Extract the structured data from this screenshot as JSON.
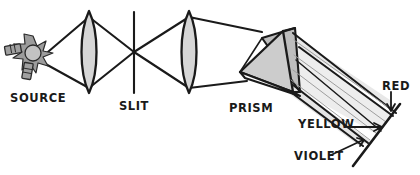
{
  "figure": {
    "type": "optics-ray-diagram",
    "width": 420,
    "height": 175,
    "background": "#ffffff",
    "ink_color": "#1a1a1a"
  },
  "labels": {
    "source": "SOURCE",
    "slit": "SLIT",
    "prism": "PRISM",
    "red": "RED",
    "yellow": "YELLOW",
    "violet": "VIOLET"
  },
  "components": [
    {
      "name": "light-source-bulb",
      "label": "SOURCE",
      "shape": "bulb-with-starburst",
      "x": 30,
      "y": 53,
      "fill": "#a8a8a8"
    },
    {
      "name": "condenser-lens",
      "label": "",
      "shape": "biconvex-lens",
      "x": 89,
      "y": 52,
      "fill": "#d6d6d6"
    },
    {
      "name": "slit-aperture",
      "label": "SLIT",
      "shape": "vertical-line",
      "x": 134,
      "y": 52,
      "fill": "none"
    },
    {
      "name": "collimating-lens",
      "label": "",
      "shape": "biconvex-lens",
      "x": 189,
      "y": 52,
      "fill": "#d6d6d6"
    },
    {
      "name": "dispersing-prism",
      "label": "PRISM",
      "shape": "triangular-prism-3d",
      "x": 285,
      "y": 70,
      "fill": "#c9c9c9"
    },
    {
      "name": "projection-screen",
      "label": "",
      "shape": "diagonal-line",
      "x": 388,
      "y": 125,
      "fill": "none"
    }
  ],
  "spectrum": [
    {
      "name": "red-band",
      "label": "RED",
      "tint": "#8c8c8c"
    },
    {
      "name": "yellow-band",
      "label": "YELLOW",
      "tint": "#bdbdbd"
    },
    {
      "name": "violet-band",
      "label": "VIOLET",
      "tint": "#6e6e6e"
    }
  ],
  "colors": {
    "ink": "#1a1a1a",
    "lens_fill": "#d6d6d6",
    "prism_fill": "#c9c9c9",
    "prism_fill_dark": "#b4b4b4",
    "beam_light": "#e2e2e2",
    "beam_mid": "#cfcfcf",
    "bulb_fill": "#a8a8a8",
    "paper": "#ffffff"
  }
}
